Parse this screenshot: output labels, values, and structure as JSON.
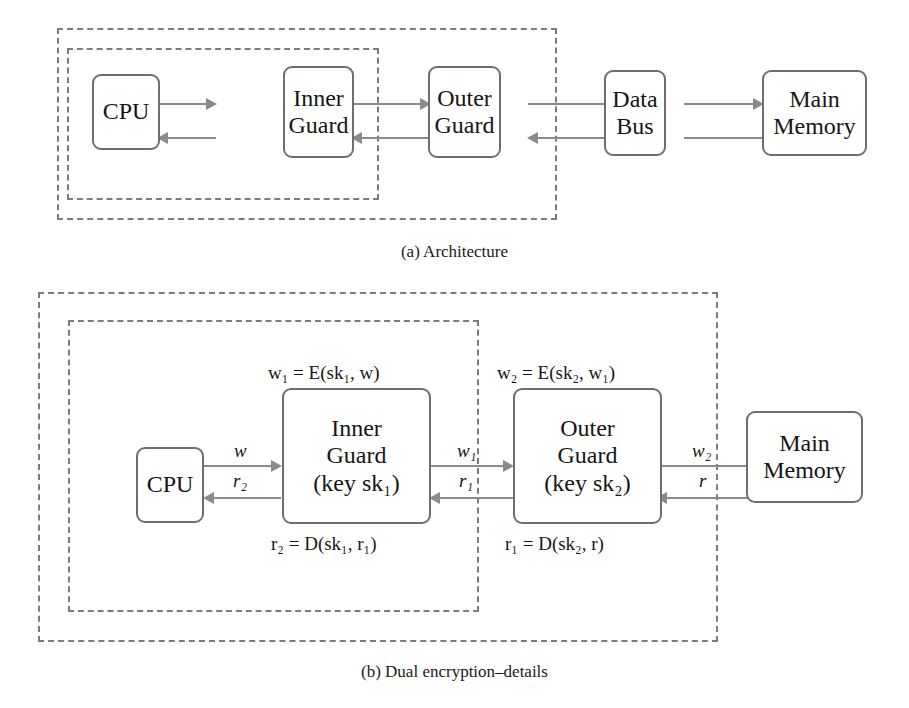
{
  "page": {
    "top_cut_heading": "SOME IMPLEMENTATION"
  },
  "figure_a": {
    "caption": "(a) Architecture",
    "nodes": [
      {
        "id": "cpu",
        "label_lines": [
          "CPU"
        ]
      },
      {
        "id": "inner-guard",
        "label_lines": [
          "Inner",
          "Guard"
        ]
      },
      {
        "id": "outer-guard",
        "label_lines": [
          "Outer",
          "Guard"
        ]
      },
      {
        "id": "data-bus",
        "label_lines": [
          "Data",
          "Bus"
        ]
      },
      {
        "id": "main-memory",
        "label_lines": [
          "Main",
          "Memory"
        ]
      }
    ],
    "boundaries": [
      {
        "id": "outer-trust-boundary",
        "style": "dashed"
      },
      {
        "id": "inner-trust-boundary",
        "style": "dashed"
      }
    ]
  },
  "figure_b": {
    "caption": "(b) Dual encryption–details",
    "nodes": [
      {
        "id": "cpu",
        "label_lines": [
          "CPU"
        ]
      },
      {
        "id": "inner-guard",
        "label_lines": [
          "Inner",
          "Guard",
          "(key sk₁)"
        ]
      },
      {
        "id": "outer-guard",
        "label_lines": [
          "Outer",
          "Guard",
          "(key sk₂)"
        ]
      },
      {
        "id": "main-memory",
        "label_lines": [
          "Main",
          "Memory"
        ]
      }
    ],
    "edge_labels": {
      "cpu_to_inner_write": "w",
      "inner_to_cpu_read": "r₂",
      "inner_to_outer_write": "w₁",
      "outer_to_inner_read": "r₁",
      "outer_to_memory_write": "w₂",
      "memory_to_outer_read": "r"
    },
    "formulas": {
      "inner_encrypt": "w₁ = E(sk₁, w)",
      "outer_encrypt": "w₂ = E(sk₂, w₁)",
      "inner_decrypt": "r₂ = D(sk₁, r₁)",
      "outer_decrypt": "r₁ = D(sk₂, r)"
    },
    "boundaries": [
      {
        "id": "outer-trust-boundary",
        "style": "dashed"
      },
      {
        "id": "inner-trust-boundary",
        "style": "dashed"
      }
    ]
  },
  "colors": {
    "box_stroke": "#6e6e6e",
    "dashed_stroke": "#7c7c7c",
    "connector": "#8a8a8a",
    "text": "#151515",
    "background": "#ffffff"
  }
}
